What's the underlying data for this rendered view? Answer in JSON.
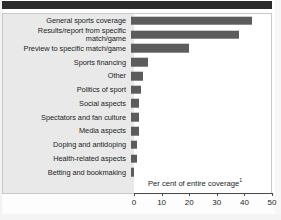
{
  "chart_data": {
    "type": "bar",
    "orientation": "horizontal",
    "title": "",
    "xlabel": "Per cent of entire coverage",
    "xlabel_superscript": "1",
    "ylabel": "",
    "xlim": [
      0,
      50
    ],
    "xticks": [
      0,
      10,
      20,
      30,
      40,
      50
    ],
    "xtick_labels": [
      "0",
      "10",
      "20",
      "30",
      "40",
      "50"
    ],
    "grid": false,
    "legend": false,
    "bar_color": "#5c5c5c",
    "categories": [
      "General sports coverage",
      "Results/report from specific match/game",
      "Preview to specific match/game",
      "Sports financing",
      "Other",
      "Politics of sport",
      "Social aspects",
      "Spectators and fan culture",
      "Media aspects",
      "Doping and antidoping",
      "Health-related aspects",
      "Betting and bookmaking"
    ],
    "values": [
      43.7,
      39.0,
      21.0,
      6.0,
      4.3,
      3.5,
      2.8,
      2.8,
      2.8,
      2.0,
      2.0,
      1.2
    ]
  },
  "rows": [
    {
      "label": "General sports coverage",
      "value": 43.7,
      "two_line": false
    },
    {
      "label": "Results/report from specific\nmatch/game",
      "value": 39.0,
      "two_line": true
    },
    {
      "label": "Preview to specific match/game",
      "value": 21.0,
      "two_line": false
    },
    {
      "label": "Sports financing",
      "value": 6.0,
      "two_line": false
    },
    {
      "label": "Other",
      "value": 4.3,
      "two_line": false
    },
    {
      "label": "Politics of sport",
      "value": 3.5,
      "two_line": false
    },
    {
      "label": "Social aspects",
      "value": 2.8,
      "two_line": false
    },
    {
      "label": "Spectators and fan culture",
      "value": 2.8,
      "two_line": false
    },
    {
      "label": "Media aspects",
      "value": 2.8,
      "two_line": false
    },
    {
      "label": "Doping and antidoping",
      "value": 2.0,
      "two_line": false
    },
    {
      "label": "Health-related aspects",
      "value": 2.0,
      "two_line": false
    },
    {
      "label": "Betting and bookmaking",
      "value": 1.2,
      "two_line": false
    }
  ],
  "axis": {
    "note": "Per cent of entire coverage",
    "note_superscript": "1",
    "ticks": [
      "0",
      "10",
      "20",
      "30",
      "40",
      "50"
    ]
  },
  "colors": {
    "bar": "#5c5c5c",
    "header_rule": "#2b2b2b",
    "label_panel": "#e9e9e9",
    "frame": "#c8c8c8",
    "text": "#1d1d1d"
  }
}
